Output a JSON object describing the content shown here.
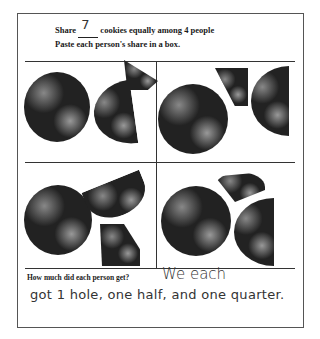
{
  "worksheet": {
    "line1_prefix": "Share",
    "line1_number": "7",
    "line1_suffix": "cookies equally among 4 people",
    "line2": "Paste each person's share in a box.",
    "question": "How much did each person get?",
    "answer_line1": "We each",
    "answer_line2": "got 1 hole, one half, and one quarter."
  },
  "boxes": [
    {
      "position": "top-left",
      "pieces": [
        "whole",
        "half",
        "quarter"
      ]
    },
    {
      "position": "top-right",
      "pieces": [
        "whole",
        "quarter",
        "half"
      ]
    },
    {
      "position": "bottom-left",
      "pieces": [
        "whole",
        "half",
        "quarter"
      ]
    },
    {
      "position": "bottom-right",
      "pieces": [
        "whole",
        "quarter",
        "half"
      ]
    }
  ]
}
